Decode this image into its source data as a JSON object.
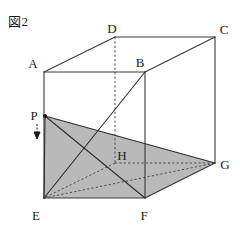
{
  "figure": {
    "caption": "図2",
    "caption_note": "Figure 2 (Japanese)",
    "width": 240,
    "height": 227,
    "background_color": "#ffffff",
    "line_color": "#3a3a3a",
    "shade_color": "#b9b9b9",
    "label_color": "#1a1a1a"
  },
  "geometry": {
    "shape": "rectangular-prism",
    "vertices": [
      {
        "name": "A",
        "x": 44,
        "y": 72,
        "label_x": 33,
        "label_y": 68,
        "hidden": false
      },
      {
        "name": "B",
        "x": 145,
        "y": 72,
        "label_x": 140,
        "label_y": 67,
        "hidden": false
      },
      {
        "name": "C",
        "x": 215,
        "y": 37,
        "label_x": 221,
        "label_y": 34,
        "hidden": false
      },
      {
        "name": "D",
        "x": 115,
        "y": 37,
        "label_x": 110,
        "label_y": 33,
        "hidden": false
      },
      {
        "name": "E",
        "x": 44,
        "y": 198,
        "label_x": 34,
        "label_y": 216,
        "hidden": false
      },
      {
        "name": "F",
        "x": 145,
        "y": 198,
        "label_x": 141,
        "label_y": 216,
        "hidden": false
      },
      {
        "name": "G",
        "x": 215,
        "y": 163,
        "label_x": 221,
        "label_y": 168,
        "hidden": false
      },
      {
        "name": "H",
        "x": 115,
        "y": 163,
        "label_x": 117,
        "label_y": 158,
        "hidden": true
      },
      {
        "name": "P",
        "x": 45,
        "y": 116,
        "label_x": 33,
        "label_y": 120,
        "hidden": false
      }
    ],
    "solid_edges": [
      [
        "A",
        "B"
      ],
      [
        "B",
        "C"
      ],
      [
        "C",
        "D"
      ],
      [
        "D",
        "A"
      ],
      [
        "E",
        "F"
      ],
      [
        "F",
        "G"
      ],
      [
        "A",
        "E"
      ],
      [
        "B",
        "F"
      ],
      [
        "C",
        "G"
      ]
    ],
    "dashed_edges": [
      [
        "D",
        "H"
      ],
      [
        "H",
        "G"
      ],
      [
        "H",
        "E"
      ]
    ],
    "cross_lines": [
      {
        "from": "B",
        "to": "E",
        "style": "solid"
      },
      {
        "from": "P",
        "to": "F",
        "style": "solid"
      },
      {
        "from": "P",
        "to": "G",
        "style": "solid"
      },
      {
        "from": "P",
        "to": "E",
        "style": "solid"
      },
      {
        "from": "E",
        "to": "G",
        "style": "dashed"
      }
    ],
    "shaded_region": {
      "label": "quadrilateral-PEFG",
      "path": [
        "P",
        "E",
        "F",
        "G"
      ],
      "fill": "#b9b9b9"
    },
    "marker": {
      "name": "point-p-arrow",
      "direction": "down",
      "x": 37,
      "y_top": 124,
      "y_bottom": 138
    }
  }
}
